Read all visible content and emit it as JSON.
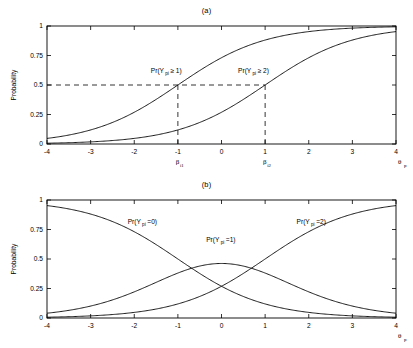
{
  "figure": {
    "background": "#ffffff",
    "line_color": "#000000"
  },
  "panel_a": {
    "title": "(a)",
    "ylabel": "Probability",
    "xlabel": "θ",
    "xlabel_sub": "p",
    "y_ticks": [
      "0",
      "0.25",
      "0.5",
      "0.75",
      "1"
    ],
    "x_ticks": [
      "-4",
      "-3",
      "-2",
      "-1",
      "0",
      "1",
      "2",
      "3",
      "4"
    ],
    "threshold1_label": "β",
    "threshold1_sub": "i1",
    "threshold2_label": "β",
    "threshold2_sub": "i2",
    "annot1_pre": "Pr(Y",
    "annot1_sub": "pi",
    "annot1_post": " ≥ 1)",
    "annot2_pre": "Pr(Y",
    "annot2_sub": "pi",
    "annot2_post": " ≥ 2)",
    "ref_level": "0.5"
  },
  "panel_b": {
    "title": "(b)",
    "ylabel": "Probability",
    "xlabel": "θ",
    "xlabel_sub": "p",
    "y_ticks": [
      "0",
      "0.25",
      "0.5",
      "0.75",
      "1"
    ],
    "x_ticks": [
      "-4",
      "-3",
      "-2",
      "-1",
      "0",
      "1",
      "2",
      "3",
      "4"
    ],
    "annot0_pre": "Pr(Y",
    "annot0_sub": "pi",
    "annot0_post": "=0)",
    "annot1_pre": "Pr(Y",
    "annot1_sub": "pi",
    "annot1_post": "=1)",
    "annot2_pre": "Pr(Y",
    "annot2_sub": "pi",
    "annot2_post": "=2)"
  },
  "chart_data": [
    {
      "type": "line",
      "title": "(a)",
      "xlabel": "theta_p",
      "ylabel": "Probability",
      "xlim": [
        -4,
        4
      ],
      "ylim": [
        0,
        1
      ],
      "xticks": [
        -4,
        -3,
        -2,
        -1,
        0,
        1,
        2,
        3,
        4
      ],
      "yticks": [
        0,
        0.25,
        0.5,
        0.75,
        1
      ],
      "grid": false,
      "legend": "none",
      "model": "graded response, cumulative logistic, slope a=1",
      "thresholds": {
        "beta_i1": -1,
        "beta_i2": 1
      },
      "annotations": [
        {
          "text": "Pr(Y_pi >= 1)",
          "x": -1.55,
          "y": 0.6
        },
        {
          "text": "Pr(Y_pi >= 2)",
          "x": 0.45,
          "y": 0.6
        },
        {
          "text": "beta_i1",
          "x": -1,
          "y": -0.13
        },
        {
          "text": "beta_i2",
          "x": 1,
          "y": -0.13
        }
      ],
      "reference_lines": [
        {
          "type": "horizontal",
          "y": 0.5,
          "style": "dashed",
          "from_x": -4,
          "to_x": 1
        },
        {
          "type": "vertical",
          "x": -1,
          "style": "dashed",
          "from_y": 0,
          "to_y": 0.5
        },
        {
          "type": "vertical",
          "x": 1,
          "style": "dashed",
          "from_y": 0,
          "to_y": 0.5
        }
      ],
      "x": [
        -4,
        -3.5,
        -3,
        -2.5,
        -2,
        -1.5,
        -1,
        -0.5,
        0,
        0.5,
        1,
        1.5,
        2,
        2.5,
        3,
        3.5,
        4
      ],
      "series": [
        {
          "name": "Pr(Y_pi >= 1)",
          "formula": "1/(1+exp(-(theta+1)))",
          "values": [
            0.047,
            0.076,
            0.119,
            0.182,
            0.269,
            0.378,
            0.5,
            0.622,
            0.731,
            0.818,
            0.881,
            0.924,
            0.953,
            0.971,
            0.982,
            0.989,
            0.993
          ]
        },
        {
          "name": "Pr(Y_pi >= 2)",
          "formula": "1/(1+exp(-(theta-1)))",
          "values": [
            0.007,
            0.011,
            0.018,
            0.029,
            0.047,
            0.076,
            0.119,
            0.182,
            0.269,
            0.378,
            0.5,
            0.622,
            0.731,
            0.818,
            0.881,
            0.924,
            0.953
          ]
        }
      ]
    },
    {
      "type": "line",
      "title": "(b)",
      "xlabel": "theta_p",
      "ylabel": "Probability",
      "xlim": [
        -4,
        4
      ],
      "ylim": [
        0,
        1
      ],
      "xticks": [
        -4,
        -3,
        -2,
        -1,
        0,
        1,
        2,
        3,
        4
      ],
      "yticks": [
        0,
        0.25,
        0.5,
        0.75,
        1
      ],
      "grid": false,
      "legend": "none",
      "model": "graded response category probabilities, slope a=1, beta_i1=-1, beta_i2=1",
      "annotations": [
        {
          "text": "Pr(Y_pi=0)",
          "x": -2.05,
          "y": 0.8
        },
        {
          "text": "Pr(Y_pi=1)",
          "x": -0.25,
          "y": 0.64
        },
        {
          "text": "Pr(Y_pi=2)",
          "x": 1.85,
          "y": 0.8
        }
      ],
      "x": [
        -4,
        -3.5,
        -3,
        -2.5,
        -2,
        -1.5,
        -1,
        -0.5,
        0,
        0.5,
        1,
        1.5,
        2,
        2.5,
        3,
        3.5,
        4
      ],
      "series": [
        {
          "name": "Pr(Y_pi=0)",
          "formula": "1 - 1/(1+exp(-(theta+1)))",
          "values": [
            0.953,
            0.924,
            0.881,
            0.818,
            0.731,
            0.622,
            0.5,
            0.378,
            0.269,
            0.182,
            0.119,
            0.076,
            0.047,
            0.029,
            0.018,
            0.011,
            0.007
          ]
        },
        {
          "name": "Pr(Y_pi=1)",
          "formula": "1/(1+exp(-(theta+1))) - 1/(1+exp(-(theta-1)))",
          "values": [
            0.04,
            0.065,
            0.101,
            0.153,
            0.222,
            0.302,
            0.381,
            0.44,
            0.462,
            0.44,
            0.381,
            0.302,
            0.222,
            0.153,
            0.101,
            0.065,
            0.04
          ],
          "peak": {
            "x": 0,
            "y": 0.462
          }
        },
        {
          "name": "Pr(Y_pi=2)",
          "formula": "1/(1+exp(-(theta-1)))",
          "values": [
            0.007,
            0.011,
            0.018,
            0.029,
            0.047,
            0.076,
            0.119,
            0.182,
            0.269,
            0.378,
            0.5,
            0.622,
            0.731,
            0.818,
            0.881,
            0.924,
            0.953
          ]
        }
      ]
    }
  ]
}
